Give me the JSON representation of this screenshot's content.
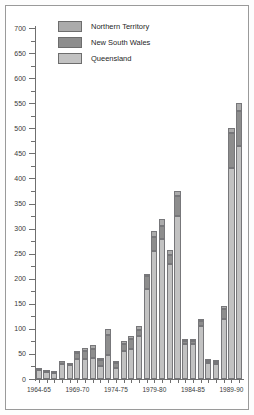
{
  "legend": {
    "position": "top-left-inside",
    "entries": [
      {
        "label": "Northern Territory",
        "key": "nt",
        "color": "#ababab"
      },
      {
        "label": "New South Wales",
        "key": "nsw",
        "color": "#8d8d8d"
      },
      {
        "label": "Queensland",
        "key": "qld",
        "color": "#c2c2c2"
      }
    ]
  },
  "axes": {
    "y_ticks": [
      "0",
      "50",
      "100",
      "150",
      "200",
      "250",
      "300",
      "350",
      "400",
      "450",
      "500",
      "550",
      "600",
      "650",
      "700"
    ],
    "x_ticks": [
      "1964-65",
      "1969-70",
      "1974-75",
      "1979-80",
      "1984-85",
      "1989-90"
    ]
  },
  "chart_data": {
    "type": "bar",
    "stacked": true,
    "title": "",
    "xlabel": "",
    "ylabel": "",
    "ylim": [
      0,
      700
    ],
    "ystep": 50,
    "yminor": 25,
    "grid": false,
    "legend_position": "top-left-inside",
    "categories": [
      "1964-65",
      "1965-66",
      "1966-67",
      "1967-68",
      "1968-69",
      "1969-70",
      "1970-71",
      "1971-72",
      "1972-73",
      "1973-74",
      "1974-75",
      "1975-76",
      "1976-77",
      "1977-78",
      "1978-79",
      "1979-80",
      "1980-81",
      "1981-82",
      "1982-83",
      "1983-84",
      "1984-85",
      "1985-86",
      "1986-87",
      "1987-88",
      "1988-89",
      "1989-90",
      "1990-91"
    ],
    "x_tick_categories": [
      "1964-65",
      "1969-70",
      "1974-75",
      "1979-80",
      "1984-85",
      "1989-90"
    ],
    "series": [
      {
        "name": "Queensland",
        "key": "qld",
        "color": "#c2c2c2",
        "values": [
          18,
          14,
          12,
          30,
          27,
          40,
          40,
          42,
          25,
          48,
          22,
          55,
          60,
          85,
          180,
          255,
          280,
          230,
          325,
          70,
          70,
          105,
          32,
          30,
          120,
          420,
          465
        ]
      },
      {
        "name": "New South Wales",
        "key": "nsw",
        "color": "#8d8d8d",
        "values": [
          2,
          2,
          2,
          5,
          4,
          12,
          15,
          18,
          12,
          40,
          10,
          15,
          20,
          12,
          25,
          28,
          25,
          18,
          40,
          5,
          5,
          10,
          4,
          3,
          20,
          70,
          70
        ]
      },
      {
        "name": "Northern Territory",
        "key": "nt",
        "color": "#ababab",
        "values": [
          0,
          0,
          0,
          0,
          0,
          3,
          6,
          8,
          5,
          12,
          3,
          5,
          6,
          8,
          5,
          12,
          15,
          10,
          10,
          2,
          2,
          5,
          2,
          2,
          5,
          10,
          15
        ]
      }
    ],
    "totals": [
      20,
      16,
      14,
      35,
      31,
      55,
      61,
      68,
      42,
      100,
      35,
      75,
      86,
      105,
      210,
      295,
      320,
      258,
      375,
      77,
      77,
      120,
      38,
      35,
      145,
      500,
      550
    ]
  }
}
